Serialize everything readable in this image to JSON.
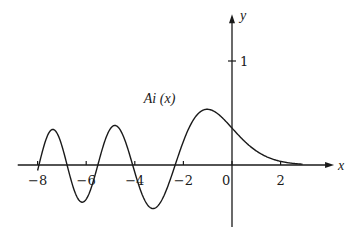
{
  "chart_data": {
    "type": "line",
    "title": "",
    "xlabel": "x",
    "ylabel": "y",
    "xlim": [
      -8.9,
      4.2
    ],
    "ylim": [
      -1.7,
      1.45
    ],
    "grid": false,
    "legend": null,
    "x_ticks": [
      -8,
      -6,
      -4,
      -2,
      0,
      2
    ],
    "x_tick_labels": [
      "−8",
      "−6",
      "−4",
      "−2",
      "0",
      "2"
    ],
    "y_ticks": [
      1
    ],
    "y_tick_labels": [
      "1"
    ],
    "annotations": [
      {
        "text": "Ai (x)",
        "x": -2.6,
        "y": 0.62
      }
    ],
    "series": [
      {
        "name": "Ai (x)",
        "function": "Airy function Ai(x)",
        "x_range": [
          -8,
          2.9
        ],
        "sample_points": [
          {
            "x": -8.0,
            "y": -0.053
          },
          {
            "x": -7.37,
            "y": 0.335
          },
          {
            "x": -6.79,
            "y": 0.0
          },
          {
            "x": -6.17,
            "y": -0.348
          },
          {
            "x": -5.52,
            "y": 0.0
          },
          {
            "x": -4.82,
            "y": 0.38
          },
          {
            "x": -4.09,
            "y": 0.0
          },
          {
            "x": -3.25,
            "y": -0.419
          },
          {
            "x": -2.34,
            "y": 0.0
          },
          {
            "x": -1.02,
            "y": 0.536
          },
          {
            "x": 0.0,
            "y": 0.355
          },
          {
            "x": 1.0,
            "y": 0.135
          },
          {
            "x": 2.0,
            "y": 0.035
          },
          {
            "x": 2.9,
            "y": 0.006
          }
        ]
      }
    ]
  },
  "layout": {
    "origin_px": [
      232,
      165
    ],
    "px_per_unit_x": 24.3,
    "px_per_unit_y": 104,
    "stroke_color": "#1a1a1a"
  }
}
